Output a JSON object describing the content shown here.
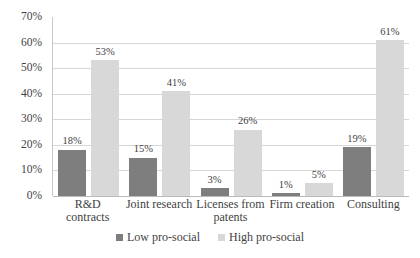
{
  "chart_data": {
    "type": "bar",
    "title": "",
    "subtitle": "",
    "xlabel": "",
    "ylabel": "",
    "ylim": [
      0,
      70
    ],
    "y_tick_step": 10,
    "y_tick_labels": [
      "70%",
      "60%",
      "50%",
      "40%",
      "30%",
      "20%",
      "10%",
      "0%"
    ],
    "y_tick_values": [
      70,
      60,
      50,
      40,
      30,
      20,
      10,
      0
    ],
    "grid": true,
    "grid_axis": "y",
    "legend_position": "bottom-center",
    "value_suffix": "%",
    "categories": [
      "R&D contracts",
      "Joint research",
      "Licenses from patents",
      "Firm creation",
      "Consulting"
    ],
    "series": [
      {
        "name": "Low pro-social",
        "color": "#7e7e7e",
        "values": [
          18,
          15,
          3,
          1,
          19
        ],
        "labels": [
          "18%",
          "15%",
          "3%",
          "1%",
          "19%"
        ]
      },
      {
        "name": "High pro-social",
        "color": "#d8d8d8",
        "values": [
          53,
          41,
          26,
          5,
          61
        ],
        "labels": [
          "53%",
          "41%",
          "26%",
          "5%",
          "61%"
        ]
      }
    ]
  },
  "legend": {
    "items": [
      {
        "label": "Low pro-social",
        "color": "#7e7e7e"
      },
      {
        "label": "High pro-social",
        "color": "#d8d8d8"
      }
    ]
  },
  "axes": {
    "y": {
      "ticks": [
        {
          "label": "70%",
          "value": 70
        },
        {
          "label": "60%",
          "value": 60
        },
        {
          "label": "50%",
          "value": 50
        },
        {
          "label": "40%",
          "value": 40
        },
        {
          "label": "30%",
          "value": 30
        },
        {
          "label": "20%",
          "value": 20
        },
        {
          "label": "10%",
          "value": 10
        },
        {
          "label": "0%",
          "value": 0
        }
      ]
    },
    "x": {
      "ticks": [
        {
          "label": "R&D contracts"
        },
        {
          "label": "Joint research"
        },
        {
          "label": "Licenses from patents"
        },
        {
          "label": "Firm creation"
        },
        {
          "label": "Consulting"
        }
      ]
    }
  }
}
